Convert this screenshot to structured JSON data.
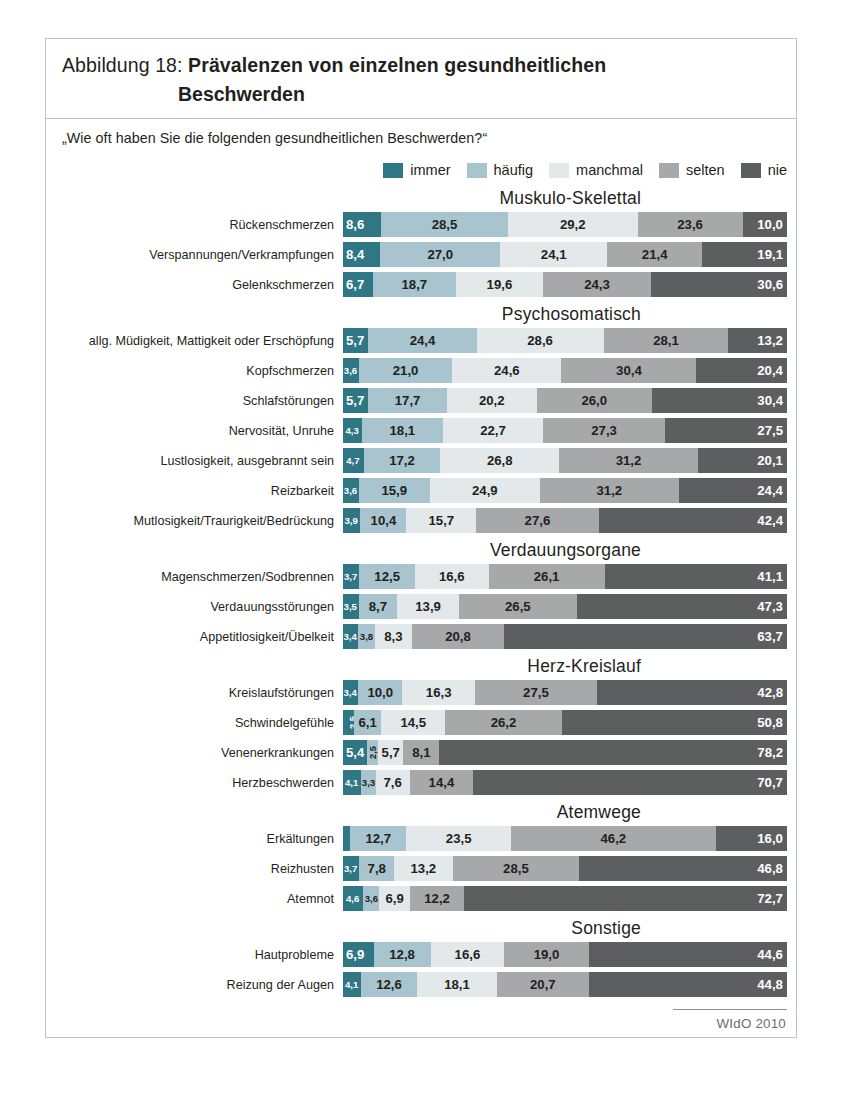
{
  "figure": {
    "title_prefix": "Abbildung 18: ",
    "title_main": "Prävalenzen von einzelnen gesundheitlichen",
    "title_line2": "Beschwerden",
    "question": "„Wie oft haben Sie die folgenden gesundheitlichen Beschwerden?“",
    "source": "WIdO 2010"
  },
  "colors": {
    "immer": "#2f7785",
    "haeufig": "#a8c4ce",
    "manchmal": "#e3e8ea",
    "selten": "#a6a8aa",
    "nie": "#5d5e60",
    "frame": "#b9c4cc"
  },
  "legend": [
    {
      "key": "immer",
      "label": "immer"
    },
    {
      "key": "haeufig",
      "label": "häufig"
    },
    {
      "key": "manchmal",
      "label": "manchmal"
    },
    {
      "key": "selten",
      "label": "selten"
    },
    {
      "key": "nie",
      "label": "nie"
    }
  ],
  "chart_data": {
    "type": "bar",
    "orientation": "horizontal",
    "stacked": true,
    "stack_total": 100,
    "title": "Abbildung 18: Prävalenzen von einzelnen gesundheitlichen Beschwerden",
    "subtitle": "„Wie oft haben Sie die folgenden gesundheitlichen Beschwerden?“",
    "xlabel": "",
    "ylabel": "",
    "xlim": [
      0,
      100
    ],
    "grid": false,
    "legend_position": "top-right",
    "series": [
      {
        "name": "immer"
      },
      {
        "name": "häufig"
      },
      {
        "name": "manchmal"
      },
      {
        "name": "selten"
      },
      {
        "name": "nie"
      }
    ],
    "groups": [
      {
        "name": "Muskulo-Skelettal",
        "rows": [
          {
            "label": "Rückenschmerzen",
            "values": [
              8.6,
              28.5,
              29.2,
              23.6,
              10.0
            ],
            "labels": [
              "8,6",
              "28,5",
              "29,2",
              "23,6",
              "10,0"
            ]
          },
          {
            "label": "Verspannungen/Verkrampfungen",
            "values": [
              8.4,
              27.0,
              24.1,
              21.4,
              19.1
            ],
            "labels": [
              "8,4",
              "27,0",
              "24,1",
              "21,4",
              "19,1"
            ]
          },
          {
            "label": "Gelenkschmerzen",
            "values": [
              6.7,
              18.7,
              19.6,
              24.3,
              30.6
            ],
            "labels": [
              "6,7",
              "18,7",
              "19,6",
              "24,3",
              "30,6"
            ]
          }
        ]
      },
      {
        "name": "Psychosomatisch",
        "rows": [
          {
            "label": "allg. Müdigkeit, Mattigkeit oder Erschöpfung",
            "values": [
              5.7,
              24.4,
              28.6,
              28.1,
              13.2
            ],
            "labels": [
              "5,7",
              "24,4",
              "28,6",
              "28,1",
              "13,2"
            ]
          },
          {
            "label": "Kopfschmerzen",
            "values": [
              3.6,
              21.0,
              24.6,
              30.4,
              20.4
            ],
            "labels": [
              "3,6",
              "21,0",
              "24,6",
              "30,4",
              "20,4"
            ]
          },
          {
            "label": "Schlafstörungen",
            "values": [
              5.7,
              17.7,
              20.2,
              26.0,
              30.4
            ],
            "labels": [
              "5,7",
              "17,7",
              "20,2",
              "26,0",
              "30,4"
            ]
          },
          {
            "label": "Nervosität, Unruhe",
            "values": [
              4.3,
              18.1,
              22.7,
              27.3,
              27.5
            ],
            "labels": [
              "4,3",
              "18,1",
              "22,7",
              "27,3",
              "27,5"
            ]
          },
          {
            "label": "Lustlosigkeit, ausgebrannt sein",
            "values": [
              4.7,
              17.2,
              26.8,
              31.2,
              20.1
            ],
            "labels": [
              "4,7",
              "17,2",
              "26,8",
              "31,2",
              "20,1"
            ]
          },
          {
            "label": "Reizbarkeit",
            "values": [
              3.6,
              15.9,
              24.9,
              31.2,
              24.4
            ],
            "labels": [
              "3,6",
              "15,9",
              "24,9",
              "31,2",
              "24,4"
            ]
          },
          {
            "label": "Mutlosigkeit/Traurigkeit/Bedrückung",
            "values": [
              3.9,
              10.4,
              15.7,
              27.6,
              42.4
            ],
            "labels": [
              "3,9",
              "10,4",
              "15,7",
              "27,6",
              "42,4"
            ]
          }
        ]
      },
      {
        "name": "Verdauungsorgane",
        "rows": [
          {
            "label": "Magenschmerzen/Sodbrennen",
            "values": [
              3.7,
              12.5,
              16.6,
              26.1,
              41.1
            ],
            "labels": [
              "3,7",
              "12,5",
              "16,6",
              "26,1",
              "41,1"
            ]
          },
          {
            "label": "Verdauungsstörungen",
            "values": [
              3.5,
              8.7,
              13.9,
              26.5,
              47.3
            ],
            "labels": [
              "3,5",
              "8,7",
              "13,9",
              "26,5",
              "47,3"
            ]
          },
          {
            "label": "Appetitlosigkeit/Übelkeit",
            "values": [
              3.4,
              3.8,
              8.3,
              20.8,
              63.7
            ],
            "labels": [
              "3,4",
              "3,8",
              "8,3",
              "20,8",
              "63,7"
            ]
          }
        ]
      },
      {
        "name": "Herz-Kreislauf",
        "rows": [
          {
            "label": "Kreislaufstörungen",
            "values": [
              3.4,
              10.0,
              16.3,
              27.5,
              42.8
            ],
            "labels": [
              "3,4",
              "10,0",
              "16,3",
              "27,5",
              "42,8"
            ]
          },
          {
            "label": "Schwindelgefühle",
            "values": [
              2.5,
              6.1,
              14.5,
              26.2,
              50.8
            ],
            "labels": [
              "2,5",
              "6,1",
              "14,5",
              "26,2",
              "50,8"
            ],
            "rotated": [
              0
            ]
          },
          {
            "label": "Venenerkrankungen",
            "values": [
              5.4,
              2.5,
              5.7,
              8.1,
              78.2
            ],
            "labels": [
              "5,4",
              "2,5",
              "5,7",
              "8,1",
              "78,2"
            ],
            "rotated": [
              1
            ]
          },
          {
            "label": "Herzbeschwerden",
            "values": [
              4.1,
              3.3,
              7.6,
              14.4,
              70.7
            ],
            "labels": [
              "4,1",
              "3,3",
              "7,6",
              "14,4",
              "70,7"
            ]
          }
        ]
      },
      {
        "name": "Atemwege",
        "rows": [
          {
            "label": "Erkältungen",
            "values": [
              1.6,
              12.7,
              23.5,
              46.2,
              16.0
            ],
            "labels": [
              "1,6",
              "12,7",
              "23,5",
              "46,2",
              "16,0"
            ],
            "rotated": [
              0
            ]
          },
          {
            "label": "Reizhusten",
            "values": [
              3.7,
              7.8,
              13.2,
              28.5,
              46.8
            ],
            "labels": [
              "3,7",
              "7,8",
              "13,2",
              "28,5",
              "46,8"
            ]
          },
          {
            "label": "Atemnot",
            "values": [
              4.6,
              3.6,
              6.9,
              12.2,
              72.7
            ],
            "labels": [
              "4,6",
              "3,6",
              "6,9",
              "12,2",
              "72,7"
            ]
          }
        ]
      },
      {
        "name": "Sonstige",
        "rows": [
          {
            "label": "Hautprobleme",
            "values": [
              6.9,
              12.8,
              16.6,
              19.0,
              44.6
            ],
            "labels": [
              "6,9",
              "12,8",
              "16,6",
              "19,0",
              "44,6"
            ]
          },
          {
            "label": "Reizung der Augen",
            "values": [
              4.1,
              12.6,
              18.1,
              20.7,
              44.8
            ],
            "labels": [
              "4,1",
              "12,6",
              "18,1",
              "20,7",
              "44,8"
            ]
          }
        ]
      }
    ]
  }
}
